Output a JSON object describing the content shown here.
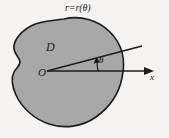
{
  "figure": {
    "kind": "polar-coordinate-region-diagram",
    "labels": {
      "boundary_curve": "r=r(θ)",
      "region": "D",
      "origin": "O",
      "angle": "θ",
      "x_axis": "x"
    },
    "colors": {
      "background": "#f6f5f3",
      "region_fill": "#a9a9a9",
      "outline": "#1c1c1c",
      "axis": "#1c1c1c",
      "text": "#1a1a1a"
    },
    "geometry": {
      "origin_point": [
        47,
        71
      ],
      "x_axis_start": [
        47,
        71
      ],
      "x_axis_end": [
        154,
        71
      ],
      "ray_start": [
        47,
        71
      ],
      "ray_end": [
        142,
        46
      ],
      "angle_arc_center": [
        47,
        71
      ],
      "angle_arc_radius": 50,
      "region_outline_note": "closed irregular blob with concave notch on left side"
    }
  }
}
